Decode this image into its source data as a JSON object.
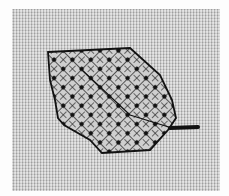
{
  "image": {
    "subject": "Blackwork embroidered leaf on woven even-weave fabric",
    "colors": {
      "fabric": "#c9c9c9",
      "thread": "#1a1a1a",
      "background": "#fdfdfd"
    }
  }
}
